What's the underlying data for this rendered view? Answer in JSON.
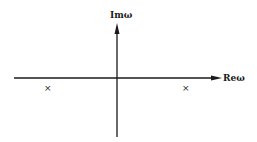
{
  "diagram": {
    "type": "complex-plane",
    "axes": {
      "imaginary_label": "Imω",
      "real_label": "Reω"
    },
    "markers": [
      {
        "symbol": "×",
        "position": "left, below real axis"
      },
      {
        "symbol": "×",
        "position": "right, below real axis"
      }
    ],
    "colors": {
      "line": "#1a1a1a",
      "background": "#ffffff"
    }
  }
}
